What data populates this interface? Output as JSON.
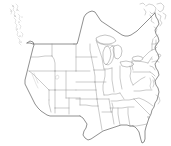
{
  "map": {
    "title": "Blank outline map of the contiguous United States",
    "region": "Contiguous United States (lower 48)",
    "projection": "Albers-like equal area conic",
    "caption": "",
    "style": {
      "background_color": "#ffffff",
      "state_boundary_color": "#8a8a8a",
      "national_outline_color": "#4a4a4a",
      "coast_detail_color": "#8f8f8f",
      "faint_detail_color": "#b4b4b4",
      "lake_fill_color": "#ffffff"
    },
    "features": {
      "state_borders": true,
      "national_border": true,
      "great_lakes": true,
      "coastal_islands": true,
      "labels": false,
      "legend": false,
      "graticule": false,
      "fill": "none"
    },
    "layers": [
      {
        "name": "national-outline",
        "label": "National and coastal outline"
      },
      {
        "name": "state-boundaries",
        "label": "State boundary lines"
      },
      {
        "name": "great-lakes",
        "label": "Great Lakes shoreline"
      },
      {
        "name": "coastal-islands",
        "label": "Pacific Northwest and Atlantic islands"
      }
    ],
    "visible_regions": [
      "Pacific Northwest",
      "California",
      "Mountain West",
      "Great Plains",
      "Texas and Gulf Coast",
      "Great Lakes",
      "Northeast",
      "Mid-Atlantic",
      "Southeast",
      "Florida Peninsula"
    ]
  }
}
